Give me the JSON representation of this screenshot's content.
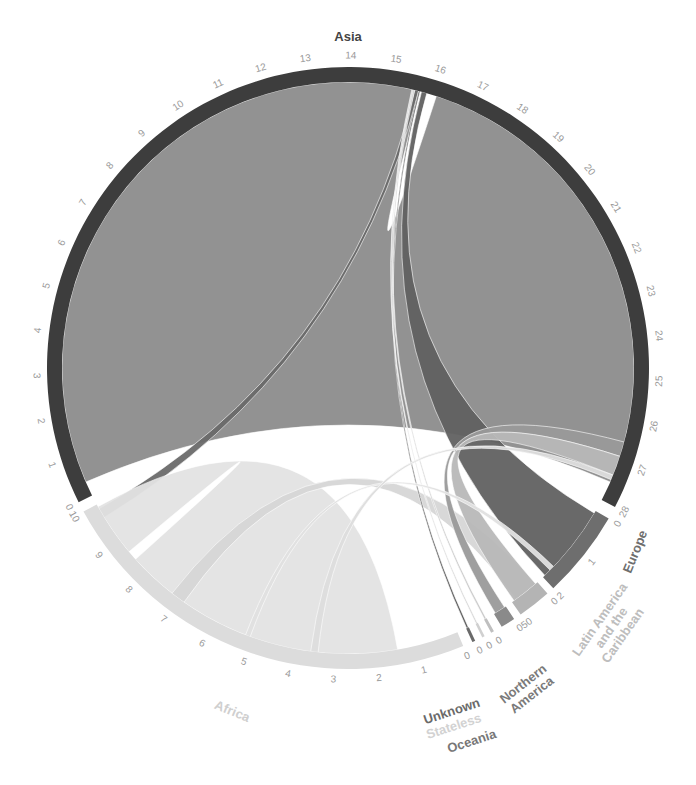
{
  "chart_data": {
    "type": "chord",
    "title": "",
    "center": [
      348,
      368
    ],
    "outer_radius": 301,
    "inner_radius": 286,
    "groups": [
      {
        "name": "Asia",
        "color": "#3d3d3d",
        "label_color": "#444444",
        "start_angle": 243.5,
        "end_angle": 117.5,
        "tick_min": 0,
        "tick_max": 28,
        "ticks": [
          0,
          1,
          2,
          3,
          4,
          5,
          6,
          7,
          8,
          9,
          10,
          11,
          12,
          13,
          14,
          15,
          16,
          17,
          18,
          19,
          20,
          21,
          22,
          23,
          24,
          25,
          26,
          27,
          28
        ],
        "label_pos": [
          348,
          38
        ],
        "label_rotate": 0
      },
      {
        "name": "Europe",
        "color": "#6e6e6e",
        "label_color": "#6e6e6e",
        "start_angle": 120.0,
        "end_angle": 137.0,
        "ticks": [
          0,
          1,
          2
        ],
        "label_pos": [
          636,
          552
        ],
        "label_rotate": -68
      },
      {
        "name": "Latin America and the Caribbean",
        "lines": [
          "Latin America",
          "and the",
          "Caribbean"
        ],
        "color": "#b4b4b4",
        "label_color": "#bdbdbd",
        "start_angle": 138.5,
        "end_angle": 145.0,
        "ticks": [
          0,
          50
        ],
        "label_pos": [
          612,
          628
        ],
        "label_rotate": -55
      },
      {
        "name": "Northern America",
        "lines": [
          "Northern",
          "America"
        ],
        "color": "#8a8a8a",
        "label_color": "#7a7a7a",
        "start_angle": 146.5,
        "end_angle": 149.3,
        "ticks": [
          0
        ],
        "label_pos": [
          528,
          690
        ],
        "label_rotate": -38
      },
      {
        "name": "Oceania",
        "color": "#bfbfbf",
        "label_color": "#777777",
        "start_angle": 151.0,
        "end_angle": 151.6,
        "ticks": [
          0
        ],
        "label_pos": [
          472,
          742
        ],
        "label_rotate": -18
      },
      {
        "name": "Stateless",
        "color": "#d0d0d0",
        "label_color": "#d2d2d2",
        "start_angle": 153.0,
        "end_angle": 153.5,
        "ticks": [
          0
        ],
        "label_pos": [
          454,
          727
        ],
        "label_rotate": -18
      },
      {
        "name": "Unknown",
        "color": "#6a6a6a",
        "label_color": "#6a6a6a",
        "start_angle": 155.0,
        "end_angle": 155.6,
        "ticks": [
          0
        ],
        "label_pos": [
          452,
          712
        ],
        "label_rotate": -18
      },
      {
        "name": "Africa",
        "color": "#dcdcdc",
        "label_color": "#cfcfcf",
        "start_angle": 157.5,
        "end_angle": 241.5,
        "ticks": [
          0,
          1,
          2,
          3,
          4,
          5,
          6,
          7,
          8,
          9,
          10
        ],
        "label_pos": [
          232,
          712
        ],
        "label_rotate": 22
      }
    ],
    "chords": [
      {
        "from": "Asia",
        "to": "Asia",
        "value": 19.5,
        "color": "#8c8c8c",
        "src": [
          246.5,
          14.6
        ],
        "dst": [
          18.0,
          113.5
        ]
      },
      {
        "from": "Asia",
        "to": "Africa",
        "value": "small",
        "color": "#6a6a6a",
        "src": [
          13.5,
          14.3
        ],
        "dst": [
          238.5,
          240.5
        ]
      },
      {
        "from": "Asia",
        "to": "Europe",
        "value": 2,
        "color": "#616161",
        "src": [
          14.9,
          16.0
        ],
        "dst": [
          120.5,
          136.5
        ]
      },
      {
        "from": "Africa",
        "to": "Africa",
        "value": 9,
        "color": "#e3e3e3",
        "src": [
          170.0,
          228.0
        ],
        "dst": [
          230.0,
          241.0
        ]
      },
      {
        "from": "Africa",
        "to": "Latin America and the Caribbean",
        "value": "small",
        "color": "#d6d6d6",
        "src": [
          215.0,
          218.0
        ],
        "dst": [
          139.0,
          144.0
        ]
      },
      {
        "from": "Northern America",
        "to": "Asia",
        "value": "small",
        "color": "#9a9a9a",
        "src": [
          146.8,
          149.0
        ],
        "dst": [
          105.0,
          108.0
        ]
      },
      {
        "from": "Latin America and the Caribbean",
        "to": "Asia",
        "value": "small",
        "color": "#b8b8b8",
        "src": [
          139.0,
          144.5
        ],
        "dst": [
          108.0,
          112.0
        ]
      },
      {
        "from": "Unknown",
        "to": "Asia",
        "value": "small",
        "color": "#555555",
        "src": [
          155.1,
          155.5
        ],
        "dst": [
          14.3,
          14.6
        ]
      },
      {
        "from": "Oceania",
        "to": "Asia",
        "value": "small",
        "color": "#c8c8c8",
        "src": [
          151.1,
          151.5
        ],
        "dst": [
          13.2,
          13.5
        ]
      },
      {
        "from": "Stateless",
        "to": "Asia",
        "value": "small",
        "color": "#d0d0d0",
        "src": [
          153.1,
          153.4
        ],
        "dst": [
          12.9,
          13.1
        ]
      },
      {
        "from": "Europe",
        "to": "Africa",
        "value": "small",
        "color": "#e0e0e0",
        "src": [
          134.0,
          135.0
        ],
        "dst": [
          200.0,
          201.0
        ]
      },
      {
        "from": "Africa",
        "to": "Asia",
        "value": "small",
        "color": "#dddddd",
        "src": [
          186.0,
          187.5
        ],
        "dst": [
          112.0,
          113.0
        ]
      }
    ]
  },
  "labels": {
    "asia": "Asia",
    "europe": "Europe",
    "latin_america": [
      "Latin America",
      "and the",
      "Caribbean"
    ],
    "northern_america": [
      "Northern",
      "America"
    ],
    "oceania": "Oceania",
    "stateless": "Stateless",
    "unknown": "Unknown",
    "africa": "Africa"
  }
}
